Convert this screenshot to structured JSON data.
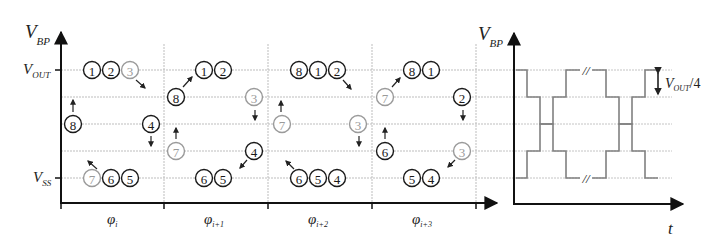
{
  "left_plot": {
    "y_axis_label": "V",
    "y_axis_sub": "BP",
    "level_top_label": "V",
    "level_top_sub": "OUT",
    "level_bottom_label": "V",
    "level_bottom_sub": "SS",
    "phases": [
      {
        "main": "φ",
        "sub": "i"
      },
      {
        "main": "φ",
        "sub": "i+1"
      },
      {
        "main": "φ",
        "sub": "i+2"
      },
      {
        "main": "φ",
        "sub": "i+3"
      }
    ],
    "nodes": [
      {
        "n": "1",
        "x": 92,
        "y": 70,
        "gray": false
      },
      {
        "n": "2",
        "x": 111,
        "y": 70,
        "gray": false
      },
      {
        "n": "3",
        "x": 130,
        "y": 70,
        "gray": true
      },
      {
        "n": "8",
        "x": 73,
        "y": 124,
        "gray": false
      },
      {
        "n": "4",
        "x": 151,
        "y": 124,
        "gray": false
      },
      {
        "n": "7",
        "x": 92,
        "y": 178,
        "gray": true
      },
      {
        "n": "6",
        "x": 111,
        "y": 178,
        "gray": false
      },
      {
        "n": "5",
        "x": 130,
        "y": 178,
        "gray": false
      },
      {
        "n": "1",
        "x": 204,
        "y": 70,
        "gray": false
      },
      {
        "n": "2",
        "x": 223,
        "y": 70,
        "gray": false
      },
      {
        "n": "8",
        "x": 176,
        "y": 97,
        "gray": false
      },
      {
        "n": "3",
        "x": 254,
        "y": 97,
        "gray": true
      },
      {
        "n": "7",
        "x": 176,
        "y": 151,
        "gray": true
      },
      {
        "n": "4",
        "x": 254,
        "y": 151,
        "gray": false
      },
      {
        "n": "6",
        "x": 204,
        "y": 178,
        "gray": false
      },
      {
        "n": "5",
        "x": 223,
        "y": 178,
        "gray": false
      },
      {
        "n": "8",
        "x": 299,
        "y": 70,
        "gray": false
      },
      {
        "n": "1",
        "x": 318,
        "y": 70,
        "gray": false
      },
      {
        "n": "2",
        "x": 337,
        "y": 70,
        "gray": false
      },
      {
        "n": "7",
        "x": 282,
        "y": 124,
        "gray": true
      },
      {
        "n": "3",
        "x": 358,
        "y": 124,
        "gray": true
      },
      {
        "n": "6",
        "x": 299,
        "y": 178,
        "gray": false
      },
      {
        "n": "5",
        "x": 318,
        "y": 178,
        "gray": false
      },
      {
        "n": "4",
        "x": 337,
        "y": 178,
        "gray": false
      },
      {
        "n": "8",
        "x": 412,
        "y": 70,
        "gray": false
      },
      {
        "n": "1",
        "x": 431,
        "y": 70,
        "gray": false
      },
      {
        "n": "7",
        "x": 385,
        "y": 97,
        "gray": true
      },
      {
        "n": "2",
        "x": 462,
        "y": 97,
        "gray": false
      },
      {
        "n": "6",
        "x": 385,
        "y": 151,
        "gray": false
      },
      {
        "n": "3",
        "x": 462,
        "y": 151,
        "gray": true
      },
      {
        "n": "5",
        "x": 412,
        "y": 178,
        "gray": false
      },
      {
        "n": "4",
        "x": 431,
        "y": 178,
        "gray": false
      }
    ],
    "arrows": [
      {
        "x1": 136,
        "y1": 80,
        "x2": 145,
        "y2": 88
      },
      {
        "x1": 73,
        "y1": 112,
        "x2": 73,
        "y2": 100
      },
      {
        "x1": 151,
        "y1": 136,
        "x2": 151,
        "y2": 146
      },
      {
        "x1": 97,
        "y1": 169,
        "x2": 88,
        "y2": 161
      },
      {
        "x1": 183,
        "y1": 87,
        "x2": 192,
        "y2": 77
      },
      {
        "x1": 176,
        "y1": 139,
        "x2": 176,
        "y2": 128
      },
      {
        "x1": 255,
        "y1": 110,
        "x2": 255,
        "y2": 120
      },
      {
        "x1": 247,
        "y1": 160,
        "x2": 240,
        "y2": 168
      },
      {
        "x1": 343,
        "y1": 80,
        "x2": 351,
        "y2": 89
      },
      {
        "x1": 281,
        "y1": 112,
        "x2": 281,
        "y2": 101
      },
      {
        "x1": 359,
        "y1": 136,
        "x2": 359,
        "y2": 146
      },
      {
        "x1": 294,
        "y1": 169,
        "x2": 286,
        "y2": 161
      },
      {
        "x1": 392,
        "y1": 87,
        "x2": 400,
        "y2": 78
      },
      {
        "x1": 385,
        "y1": 139,
        "x2": 385,
        "y2": 128
      },
      {
        "x1": 463,
        "y1": 110,
        "x2": 463,
        "y2": 120
      },
      {
        "x1": 455,
        "y1": 160,
        "x2": 448,
        "y2": 167
      }
    ]
  },
  "right_plot": {
    "y_axis_label": "V",
    "y_axis_sub": "BP",
    "x_axis_label": "t",
    "step_label": "V",
    "step_sub": "OUT",
    "step_suffix": "/4",
    "break_mark": "//"
  },
  "chart_data": {
    "type": "line",
    "title": "",
    "ylabel": "V_BP",
    "xlabel": "t",
    "levels": [
      "V_OUT",
      "3V_OUT/4",
      "V_OUT/2",
      "V_OUT/4",
      "V_SS"
    ],
    "phases": [
      "φ_i",
      "φ_i+1",
      "φ_i+2",
      "φ_i+3"
    ],
    "node_positions_by_phase": {
      "φ_i": {
        "V_OUT": [
          "1",
          "2",
          "3"
        ],
        "3V_OUT/4": [],
        "V_OUT/2": [
          "8",
          "4"
        ],
        "V_OUT/4": [],
        "V_SS": [
          "7",
          "6",
          "5"
        ]
      },
      "φ_i+1": {
        "V_OUT": [
          "1",
          "2"
        ],
        "3V_OUT/4": [
          "8",
          "3"
        ],
        "V_OUT/2": [],
        "V_OUT/4": [
          "7",
          "4"
        ],
        "V_SS": [
          "6",
          "5"
        ]
      },
      "φ_i+2": {
        "V_OUT": [
          "8",
          "1",
          "2"
        ],
        "3V_OUT/4": [],
        "V_OUT/2": [
          "7",
          "3"
        ],
        "V_OUT/4": [],
        "V_SS": [
          "6",
          "5",
          "4"
        ]
      },
      "φ_i+3": {
        "V_OUT": [
          "8",
          "1"
        ],
        "3V_OUT/4": [
          "7",
          "2"
        ],
        "V_OUT/2": [],
        "V_OUT/4": [
          "6",
          "3"
        ],
        "V_SS": [
          "5",
          "4"
        ]
      }
    },
    "step_size": "V_OUT/4"
  }
}
